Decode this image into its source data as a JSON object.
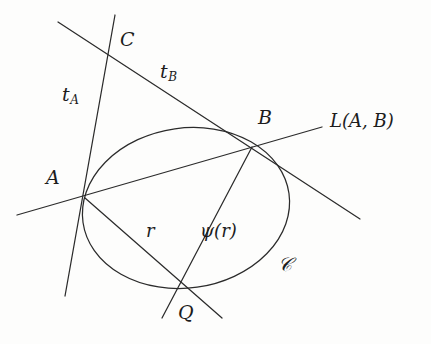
{
  "figure": {
    "kind": "geometry-diagram",
    "title": "",
    "stroke_color": "#2b2b2b",
    "background_color": "#fdfdfc",
    "width": 431,
    "height": 344
  },
  "labels": {
    "point_a": "A",
    "point_b": "B",
    "point_c": "C",
    "point_q": "Q",
    "tangent_a": "t",
    "tangent_a_sub": "A",
    "tangent_b": "t",
    "tangent_b_sub": "B",
    "secant_line": "L(A, B)",
    "radius": "r",
    "psi_of_r": "ψ(r)",
    "curve": "𝒞"
  },
  "geometry": {
    "conic": {
      "name": "ellipse-C",
      "center_x": 186,
      "center_y": 208,
      "radius_x": 104,
      "radius_y": 80,
      "rotation_deg": -8
    },
    "points": [
      {
        "name": "A",
        "x": 85,
        "y": 198
      },
      {
        "name": "B",
        "x": 252,
        "y": 147
      },
      {
        "name": "C",
        "x": 110,
        "y": 58
      },
      {
        "name": "Q",
        "x": 180,
        "y": 284
      }
    ],
    "segments": [
      {
        "name": "tangent-line-a",
        "x1": 115,
        "y1": 15,
        "x2": 65,
        "y2": 296
      },
      {
        "name": "tangent-line-b",
        "x1": 58,
        "y1": 22,
        "x2": 360,
        "y2": 219
      },
      {
        "name": "secant-line-ab",
        "x1": 17,
        "y1": 215,
        "x2": 322,
        "y2": 127
      },
      {
        "name": "chord-a-q",
        "x1": 85,
        "y1": 198,
        "x2": 222,
        "y2": 318
      },
      {
        "name": "chord-b-q",
        "x1": 252,
        "y1": 147,
        "x2": 162,
        "y2": 318
      }
    ]
  },
  "label_positions": {
    "point_a": {
      "x": 46,
      "y": 168
    },
    "point_b": {
      "x": 258,
      "y": 108
    },
    "point_c": {
      "x": 120,
      "y": 30
    },
    "point_q": {
      "x": 178,
      "y": 303
    },
    "tangent_a": {
      "x": 62,
      "y": 85
    },
    "tangent_b": {
      "x": 160,
      "y": 62
    },
    "secant_line": {
      "x": 330,
      "y": 112
    },
    "radius": {
      "x": 146,
      "y": 222
    },
    "psi_of_r": {
      "x": 200,
      "y": 222
    },
    "curve": {
      "x": 278,
      "y": 255
    }
  }
}
